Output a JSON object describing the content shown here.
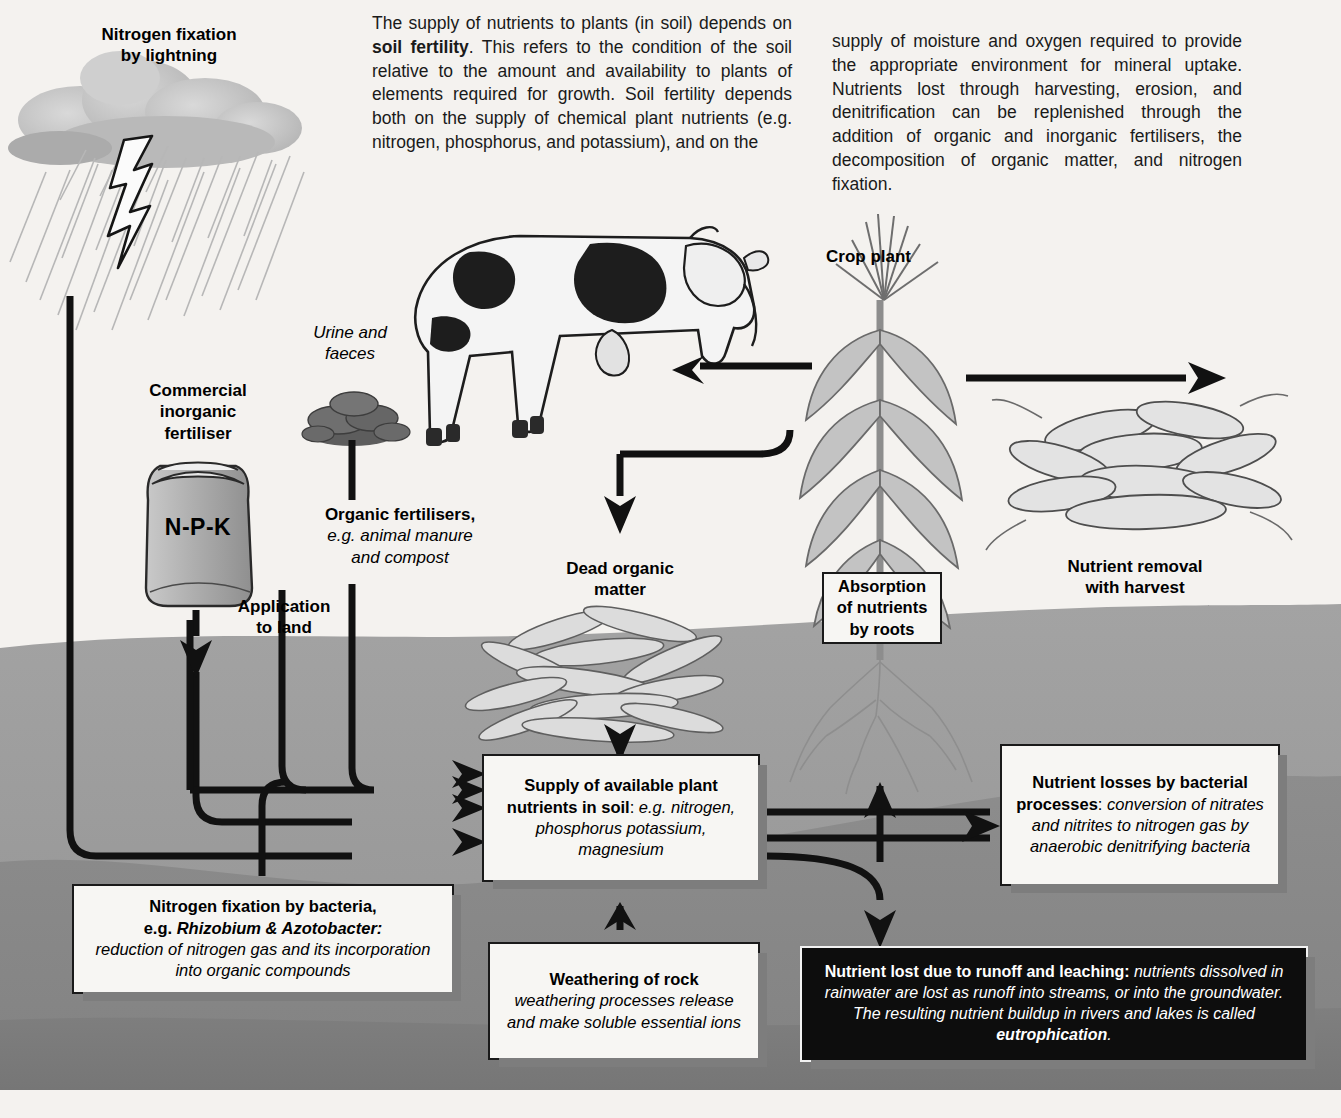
{
  "intro": {
    "column_1": "The supply of nutrients to plants (in soil) depends on <b>soil fertility</b>. This refers to the condition of the soil relative to the amount and availability to plants of elements required for growth. Soil fertility depends both on the supply of chemical plant nutrients (e.g. nitrogen, phosphorus, and potassium), and on the",
    "column_2": "supply of moisture and oxygen required to provide the appropriate environment for mineral uptake. Nutrients lost through harvesting, erosion, and denitrification can be replenished through the addition of organic and inorganic fertilisers, the decomposition of organic matter, and nitrogen fixation."
  },
  "labels": {
    "nitrogen_fixation_lightning": "Nitrogen fixation\nby lightning",
    "commercial_inorganic_fertiliser": "Commercial\ninorganic\nfertiliser",
    "npk_bag": "N-P-K",
    "application_to_land": "Application\nto land",
    "urine_and_faeces": "Urine and\nfaeces",
    "organic_fertilisers_bold": "Organic fertilisers,",
    "organic_fertilisers_italic": "e.g. animal manure\nand compost",
    "dead_organic_matter": "Dead organic\nmatter",
    "crop_plant": "Crop plant",
    "nutrient_removal_with_harvest": "Nutrient removal\nwith harvest"
  },
  "boxes": {
    "absorption": {
      "name": "absorption-of-nutrients-by-roots",
      "text": "Absorption\nof nutrients\nby roots"
    },
    "supply": {
      "name": "supply-of-available-plant-nutrients",
      "bold": "Supply of available plant nutrients in soil",
      "separator": ": ",
      "italic": "e.g. nitrogen, phosphorus potassium, magnesium"
    },
    "bacterial_losses": {
      "name": "nutrient-losses-by-bacterial-processes",
      "bold": "Nutrient losses by bacterial processes",
      "separator": ": ",
      "italic": "conversion of nitrates and nitrites to nitrogen gas by anaerobic denitrifying bacteria"
    },
    "nitrogen_fixation_bacteria": {
      "name": "nitrogen-fixation-by-bacteria",
      "bold_line_1": "Nitrogen fixation by bacteria,",
      "bold_line_2_plain": "e.g. ",
      "bold_line_2_italic": "Rhizobium & Azotobacter:",
      "italic": "reduction of nitrogen gas and its incorporation into organic compounds"
    },
    "weathering": {
      "name": "weathering-of-rock",
      "bold": "Weathering of rock",
      "italic": "weathering processes release and make soluble essential ions"
    },
    "runoff": {
      "name": "nutrient-lost-due-to-runoff-and-leaching",
      "bold_lead": "Nutrient lost due to runoff and leaching:",
      "italic_body": " nutrients dissolved in rainwater are lost as runoff into streams, or into the groundwater. The resulting nutrient buildup in rivers and lakes is called ",
      "bold_tail": "eutrophication",
      "period": "."
    }
  },
  "illustrations": [
    {
      "name": "storm-cloud-with-rain-and-lightning",
      "caption": "Nitrogen fixation by lightning"
    },
    {
      "name": "fertiliser-sack",
      "caption": "N-P-K"
    },
    {
      "name": "dung-pile",
      "caption": "Urine and faeces"
    },
    {
      "name": "dairy-cow",
      "caption": "Crop plant consumer"
    },
    {
      "name": "dead-leaf-litter-pile",
      "caption": "Dead organic matter"
    },
    {
      "name": "maize-crop-plant-with-roots",
      "caption": "Crop plant"
    },
    {
      "name": "harvested-maize-cobs",
      "caption": "Nutrient removal with harvest"
    }
  ],
  "colors": {
    "page_background": "#f4f2ef",
    "topsoil": "#9a9a9a",
    "subsoil": "#8a8a8a",
    "deep_soil": "#7d7d7d",
    "box_fill": "#f7f6f3",
    "box_border": "#1a1a1a",
    "dark_box_fill": "#0d0d0d",
    "dark_box_text": "#ffffff",
    "arrow": "#111111",
    "shadow": "#7d7d7d"
  }
}
